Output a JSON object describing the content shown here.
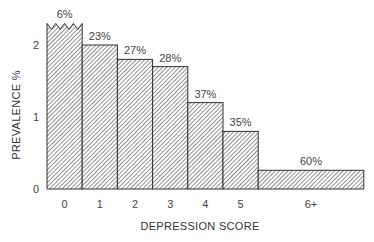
{
  "chart_data": {
    "type": "bar",
    "title": "",
    "xlabel": "DEPRESSION SCORE",
    "ylabel": "PREVALENCE %",
    "categories": [
      "0",
      "1",
      "2",
      "3",
      "4",
      "5",
      "6+"
    ],
    "values": [
      2.3,
      2.0,
      1.8,
      1.7,
      1.2,
      0.8,
      0.26
    ],
    "truncated": [
      true,
      false,
      false,
      false,
      false,
      false,
      false
    ],
    "bar_labels": [
      "6%",
      "23%",
      "27%",
      "28%",
      "37%",
      "35%",
      "60%"
    ],
    "bar_widths": [
      1,
      1,
      1,
      1,
      1,
      1,
      3
    ],
    "yticks": [
      0,
      1,
      2
    ],
    "ylim": [
      0,
      2.3
    ],
    "grid": false,
    "legend": null,
    "fill": "diagonal-hatch",
    "colors": {
      "stroke": "#333333",
      "hatch": "#555555",
      "background": "#ffffff"
    }
  }
}
